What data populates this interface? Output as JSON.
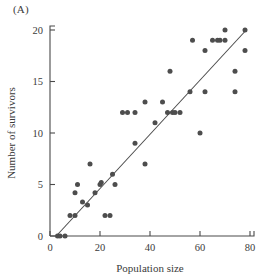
{
  "panel": {
    "label": "(A)"
  },
  "chart_data": {
    "type": "scatter",
    "title": "",
    "subtitle": "",
    "panel_label": "(A)",
    "xlabel": "Population size",
    "ylabel": "Number of survivors",
    "xlim": [
      0,
      82
    ],
    "ylim": [
      0,
      20.6
    ],
    "xticks": [
      0,
      20,
      40,
      60,
      80
    ],
    "yticks": [
      0,
      5,
      10,
      15,
      20
    ],
    "xtick_labels": [
      "0",
      "20",
      "40",
      "60",
      "80"
    ],
    "ytick_labels": [
      "0",
      "5",
      "10",
      "15",
      "20"
    ],
    "grid": false,
    "legend": null,
    "marker_color": "#4d4d4d",
    "line_color": "#4a4a4a",
    "axis_color": "#4a4a4a",
    "background_color": "#ffffff",
    "points": [
      [
        3,
        0
      ],
      [
        4,
        0
      ],
      [
        6,
        0
      ],
      [
        8,
        2
      ],
      [
        10,
        2
      ],
      [
        10,
        4.2
      ],
      [
        11,
        5
      ],
      [
        13,
        3.3
      ],
      [
        15,
        3
      ],
      [
        16,
        7
      ],
      [
        18,
        4.2
      ],
      [
        20,
        5
      ],
      [
        20.5,
        5.2
      ],
      [
        22,
        2
      ],
      [
        24,
        2
      ],
      [
        25,
        6
      ],
      [
        26,
        5
      ],
      [
        29,
        12
      ],
      [
        31,
        12
      ],
      [
        34,
        12
      ],
      [
        34,
        9
      ],
      [
        38,
        7
      ],
      [
        38,
        13
      ],
      [
        42,
        11
      ],
      [
        45,
        13
      ],
      [
        47,
        12
      ],
      [
        49,
        12
      ],
      [
        50,
        12
      ],
      [
        52,
        12
      ],
      [
        56,
        14
      ],
      [
        57,
        19
      ],
      [
        60,
        10
      ],
      [
        62,
        18
      ],
      [
        62,
        14
      ],
      [
        65,
        19
      ],
      [
        67,
        19
      ],
      [
        68,
        19
      ],
      [
        70,
        19
      ],
      [
        70,
        20
      ],
      [
        74,
        16
      ],
      [
        74,
        14
      ],
      [
        48,
        16
      ],
      [
        78,
        20
      ],
      [
        78,
        18
      ]
    ],
    "fit_line": {
      "x0": 2.5,
      "y0": 0,
      "x1": 78.5,
      "y1": 20
    }
  }
}
